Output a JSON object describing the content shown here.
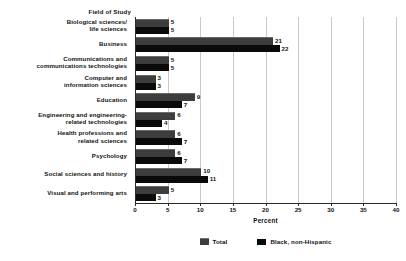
{
  "chart_data": {
    "type": "bar",
    "orientation": "horizontal",
    "title": "",
    "category_header": "Field of Study",
    "xlabel": "Percent",
    "ylabel": "",
    "xlim": [
      0,
      40
    ],
    "xticks": [
      0,
      5,
      10,
      15,
      20,
      25,
      30,
      35,
      40
    ],
    "xtick_labels": [
      "0",
      "5",
      "10",
      "15",
      "20",
      "25",
      "30",
      "35",
      "40"
    ],
    "grid": true,
    "legend_position": "bottom",
    "categories": [
      "Biological sciences/ life sciences",
      "Business",
      "Communications and communications technologies",
      "Computer and information sciences",
      "Education",
      "Engineering and engineering-related technologies",
      "Health professions and related sciences",
      "Psychology",
      "Social sciences and history",
      "Visual and performing arts"
    ],
    "category_lines": [
      [
        "Biological sciences/",
        "life sciences"
      ],
      [
        "Business"
      ],
      [
        "Communications and",
        "communications technologies"
      ],
      [
        "Computer and",
        "information sciences"
      ],
      [
        "Education"
      ],
      [
        "Engineering and engineering-",
        "related technologies"
      ],
      [
        "Health professions and",
        "related sciences"
      ],
      [
        "Psychology"
      ],
      [
        "Social sciences and history"
      ],
      [
        "Visual and performing arts"
      ]
    ],
    "series": [
      {
        "name": "Total",
        "color": "#3d3d3d",
        "values": [
          5,
          21,
          5,
          3,
          9,
          6,
          6,
          6,
          10,
          5
        ]
      },
      {
        "name": "Black, non-Hispanic",
        "color": "#0a0a0a",
        "values": [
          5,
          22,
          5,
          3,
          7,
          4,
          7,
          7,
          11,
          3
        ]
      }
    ]
  },
  "legend": {
    "items": [
      {
        "label": "Total",
        "color": "#3d3d3d"
      },
      {
        "label": "Black, non-Hispanic",
        "color": "#0a0a0a"
      }
    ]
  }
}
